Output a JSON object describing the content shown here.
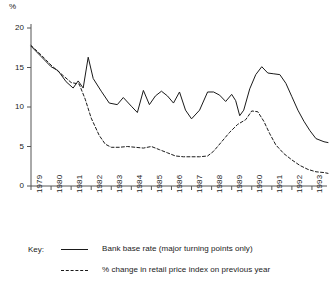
{
  "chart_data": {
    "type": "line",
    "title": "",
    "subtitle": "",
    "xlabel": "",
    "ylabel": "%",
    "unit_label": "%",
    "grid": false,
    "legend_position": "below",
    "legend_title": "Key:",
    "xlim": [
      1979,
      1993.75
    ],
    "ylim": [
      0,
      20
    ],
    "yticks": [
      0,
      5,
      10,
      15,
      20
    ],
    "ytick_labels": [
      "0",
      "5",
      "10",
      "15",
      "20"
    ],
    "xticks": [
      1979,
      1980,
      1981,
      1982,
      1983,
      1984,
      1985,
      1986,
      1987,
      1988,
      1989,
      1990,
      1991,
      1992,
      1993
    ],
    "xtick_labels": [
      "1979",
      "1980",
      "1981",
      "1982",
      "1983",
      "1984",
      "1985",
      "1986",
      "1987",
      "1988",
      "1989",
      "1990",
      "1991",
      "1992",
      "1993"
    ],
    "series": [
      {
        "name": "Bank base rate (major turning points only)",
        "style": "solid",
        "color": "#1a1a1a",
        "points": [
          [
            1979.0,
            17.7
          ],
          [
            1979.5,
            16.4
          ],
          [
            1980.0,
            15.1
          ],
          [
            1980.35,
            14.6
          ],
          [
            1980.75,
            13.2
          ],
          [
            1981.1,
            12.4
          ],
          [
            1981.35,
            13.3
          ],
          [
            1981.6,
            12.4
          ],
          [
            1981.85,
            16.3
          ],
          [
            1982.1,
            13.6
          ],
          [
            1982.5,
            12.0
          ],
          [
            1982.9,
            10.5
          ],
          [
            1983.3,
            10.3
          ],
          [
            1983.6,
            11.2
          ],
          [
            1984.0,
            10.1
          ],
          [
            1984.3,
            9.3
          ],
          [
            1984.6,
            12.1
          ],
          [
            1984.9,
            10.3
          ],
          [
            1985.2,
            11.4
          ],
          [
            1985.5,
            12.0
          ],
          [
            1985.8,
            11.4
          ],
          [
            1986.1,
            10.5
          ],
          [
            1986.4,
            11.9
          ],
          [
            1986.7,
            9.6
          ],
          [
            1987.0,
            8.5
          ],
          [
            1987.4,
            9.6
          ],
          [
            1987.8,
            11.9
          ],
          [
            1988.1,
            11.9
          ],
          [
            1988.4,
            11.5
          ],
          [
            1988.7,
            10.7
          ],
          [
            1989.0,
            11.6
          ],
          [
            1989.2,
            10.8
          ],
          [
            1989.4,
            8.9
          ],
          [
            1989.6,
            9.6
          ],
          [
            1989.9,
            12.3
          ],
          [
            1990.2,
            14.1
          ],
          [
            1990.5,
            15.1
          ],
          [
            1990.8,
            14.3
          ],
          [
            1991.1,
            14.2
          ],
          [
            1991.4,
            14.1
          ],
          [
            1991.7,
            13.0
          ],
          [
            1992.0,
            11.3
          ],
          [
            1992.3,
            9.6
          ],
          [
            1992.6,
            8.2
          ],
          [
            1992.9,
            7.0
          ],
          [
            1993.2,
            6.0
          ],
          [
            1993.6,
            5.6
          ],
          [
            1993.8,
            5.5
          ]
        ]
      },
      {
        "name": "% change in retail price index on previous year",
        "style": "dashed",
        "color": "#1a1a1a",
        "points": [
          [
            1979.0,
            17.8
          ],
          [
            1979.5,
            16.6
          ],
          [
            1980.0,
            15.3
          ],
          [
            1980.5,
            14.2
          ],
          [
            1981.0,
            13.1
          ],
          [
            1981.4,
            12.9
          ],
          [
            1981.7,
            11.0
          ],
          [
            1982.0,
            8.6
          ],
          [
            1982.4,
            6.4
          ],
          [
            1982.7,
            5.3
          ],
          [
            1983.0,
            4.9
          ],
          [
            1983.4,
            4.9
          ],
          [
            1983.8,
            5.0
          ],
          [
            1984.2,
            4.9
          ],
          [
            1984.6,
            4.8
          ],
          [
            1985.0,
            5.0
          ],
          [
            1985.4,
            4.6
          ],
          [
            1985.8,
            4.2
          ],
          [
            1986.2,
            3.8
          ],
          [
            1986.6,
            3.7
          ],
          [
            1987.0,
            3.7
          ],
          [
            1987.4,
            3.7
          ],
          [
            1987.8,
            3.8
          ],
          [
            1988.1,
            4.4
          ],
          [
            1988.5,
            5.6
          ],
          [
            1988.9,
            6.8
          ],
          [
            1989.3,
            7.8
          ],
          [
            1989.7,
            8.4
          ],
          [
            1990.0,
            9.5
          ],
          [
            1990.3,
            9.4
          ],
          [
            1990.6,
            8.2
          ],
          [
            1990.9,
            6.6
          ],
          [
            1991.2,
            5.2
          ],
          [
            1991.6,
            4.1
          ],
          [
            1992.0,
            3.3
          ],
          [
            1992.4,
            2.6
          ],
          [
            1992.8,
            2.1
          ],
          [
            1993.2,
            1.8
          ],
          [
            1993.6,
            1.7
          ],
          [
            1993.8,
            1.6
          ]
        ]
      }
    ]
  },
  "axis": {
    "unit_label": "%"
  },
  "legend": {
    "title": "Key:",
    "entries": [
      {
        "label": "Bank base rate (major turning points only)",
        "style": "solid"
      },
      {
        "label": "% change in retail price index on previous year",
        "style": "dashed"
      }
    ]
  }
}
